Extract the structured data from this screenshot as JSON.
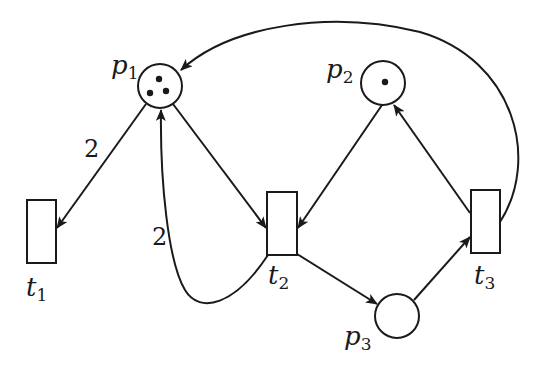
{
  "diagram": {
    "type": "petri-net",
    "colors": {
      "stroke": "#1a1a1a",
      "background": "#ffffff"
    },
    "places": [
      {
        "id": "p1",
        "name": "p",
        "sub": "1",
        "tokens": 3
      },
      {
        "id": "p2",
        "name": "p",
        "sub": "2",
        "tokens": 1
      },
      {
        "id": "p3",
        "name": "p",
        "sub": "3",
        "tokens": 0
      }
    ],
    "transitions": [
      {
        "id": "t1",
        "name": "t",
        "sub": "1"
      },
      {
        "id": "t2",
        "name": "t",
        "sub": "2"
      },
      {
        "id": "t3",
        "name": "t",
        "sub": "3"
      }
    ],
    "arcs": [
      {
        "from": "p1",
        "to": "t1",
        "weight": "2"
      },
      {
        "from": "p1",
        "to": "t2",
        "weight": ""
      },
      {
        "from": "t2",
        "to": "p1",
        "weight": "2"
      },
      {
        "from": "p2",
        "to": "t2",
        "weight": ""
      },
      {
        "from": "t2",
        "to": "p3",
        "weight": ""
      },
      {
        "from": "p3",
        "to": "t3",
        "weight": ""
      },
      {
        "from": "t3",
        "to": "p2",
        "weight": ""
      },
      {
        "from": "t3",
        "to": "p1",
        "weight": ""
      }
    ]
  }
}
